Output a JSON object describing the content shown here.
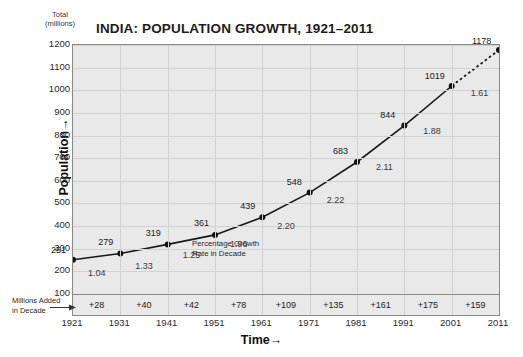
{
  "chart_data": {
    "type": "line",
    "title": "INDIA: POPULATION GROWTH, 1921–2011",
    "xlabel": "Time",
    "ylabel": "Population",
    "y_unit_caption_line1": "Total",
    "y_unit_caption_line2": "(millions)",
    "xlim": [
      1921,
      2011
    ],
    "ylim": [
      100,
      1200
    ],
    "grid": true,
    "legend": "none",
    "x": [
      1921,
      1931,
      1941,
      1951,
      1961,
      1971,
      1981,
      1991,
      2001,
      2011
    ],
    "categories": [
      "1921",
      "1931",
      "1941",
      "1951",
      "1961",
      "1971",
      "1981",
      "1991",
      "2001",
      "2011"
    ],
    "values": [
      251,
      279,
      319,
      361,
      439,
      548,
      683,
      844,
      1019,
      1178
    ],
    "point_labels": [
      "251",
      "279",
      "319",
      "361",
      "439",
      "548",
      "683",
      "844",
      "1019",
      "1178"
    ],
    "yticks": [
      "100",
      "200",
      "300",
      "400",
      "500",
      "600",
      "700",
      "800",
      "900",
      "1000",
      "1100",
      "1200"
    ],
    "ytick_values": [
      100,
      200,
      300,
      400,
      500,
      600,
      700,
      800,
      900,
      1000,
      1100,
      1200
    ],
    "growth_rate_series": {
      "name": "Percentage Growth Rate in Decade",
      "decades": [
        "1921–1931",
        "1931–1941",
        "1941–1951",
        "1951–1961",
        "1961–1971",
        "1971–1981",
        "1981–1991",
        "1991–2001",
        "2001–2011"
      ],
      "values": [
        "1.04",
        "1.33",
        "1.25",
        "1.96",
        "2.20",
        "2.22",
        "2.11",
        "1.88",
        "1.61"
      ]
    },
    "millions_added_series": {
      "name": "Millions Added in Decade",
      "label_line1": "Millions Added",
      "label_line2": "in Decade",
      "values": [
        "+28",
        "+40",
        "+42",
        "+78",
        "+109",
        "+135",
        "+161",
        "+175",
        "+159"
      ]
    },
    "annotations": [
      {
        "text_line1": "Percentage Growth",
        "text_line2": "Rate in Decade"
      }
    ],
    "last_segment_style": "dotted",
    "colors": {
      "plot_background": "#e9e9e9",
      "grid": "#d2d2d2",
      "line": "#1a1a1a",
      "marker": "#111111",
      "border": "#8a8a8a",
      "page_background": "#ffffff"
    }
  }
}
